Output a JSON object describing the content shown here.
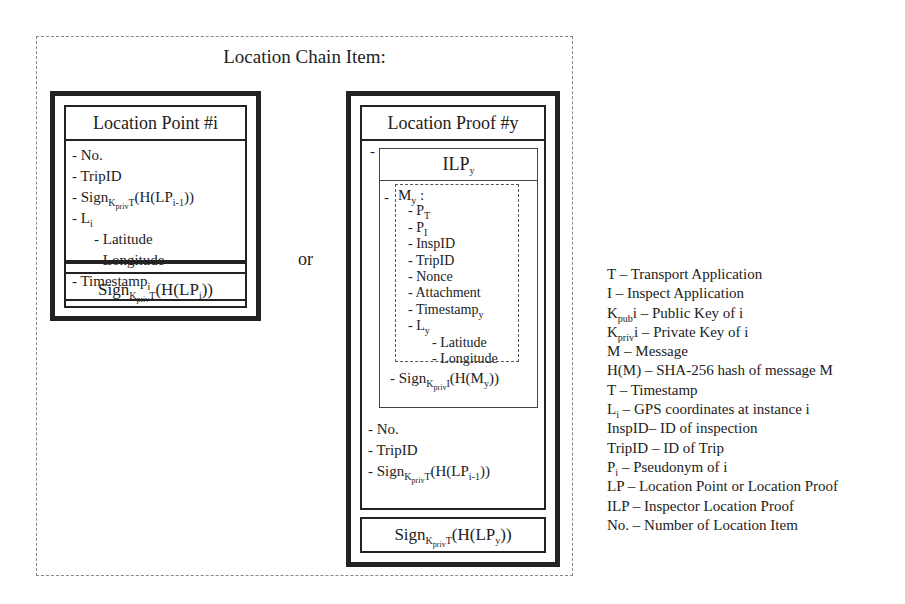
{
  "title": "Location Chain Item:",
  "separator": "or",
  "location_point": {
    "header": "Location Point #i",
    "items": [
      {
        "prefix": "- ",
        "text": "No.",
        "indent": 0
      },
      {
        "prefix": "- ",
        "text": "TripID",
        "indent": 0
      },
      {
        "prefix": "- ",
        "text": "Sign",
        "sub": "KprivT",
        "suffix": "(H(LP",
        "sub2": "i-1",
        "suffix2": "))",
        "indent": 0
      },
      {
        "prefix": "- ",
        "text": "L",
        "sub": "i",
        "indent": 0
      },
      {
        "prefix": "- ",
        "text": "Latitude",
        "indent": 1
      },
      {
        "prefix": "- ",
        "text": "Longitude",
        "indent": 1
      },
      {
        "prefix": "- ",
        "text": "Timestamp",
        "sub": "i",
        "indent": 0
      }
    ],
    "signature": {
      "text": "Sign",
      "sub": "KprivT",
      "suffix": "(H(LP",
      "sub2": "i",
      "suffix2": "))"
    }
  },
  "location_proof": {
    "header": "Location Proof #y",
    "ilp_dash": "-",
    "ilp": {
      "text": "ILP",
      "sub": "y"
    },
    "message": {
      "label": "M",
      "label_sub": "y",
      "label_suffix": " :",
      "items": [
        {
          "text": "P",
          "sub": "T",
          "indent": 0
        },
        {
          "text": "P",
          "sub": "I",
          "indent": 0
        },
        {
          "text": "InspID",
          "indent": 0
        },
        {
          "text": "TripID",
          "indent": 0
        },
        {
          "text": "Nonce",
          "indent": 0
        },
        {
          "text": "Attachment",
          "indent": 0
        },
        {
          "text": "Timestamp",
          "sub": "y",
          "indent": 0
        },
        {
          "text": "L",
          "sub": "y",
          "indent": 0
        },
        {
          "text": "Latitude",
          "indent": 1
        },
        {
          "text": "Longitude",
          "indent": 1
        }
      ]
    },
    "ilp_signature": {
      "prefix": "- ",
      "text": "Sign",
      "sub": "KprivI",
      "suffix": "(H(M",
      "sub2": "y",
      "suffix2": "))"
    },
    "items": [
      {
        "prefix": "- ",
        "text": "No."
      },
      {
        "prefix": "- ",
        "text": "TripID"
      },
      {
        "prefix": "- ",
        "text": "Sign",
        "sub": "KprivT",
        "suffix": "(H(LP",
        "sub2": "i-1",
        "suffix2": "))"
      }
    ],
    "signature": {
      "text": "Sign",
      "sub": "KprivT",
      "suffix": "(H(LP",
      "sub2": "y",
      "suffix2": "))"
    }
  },
  "legend": [
    {
      "term": "T",
      "sub": "",
      "sep": " – ",
      "desc": "Transport Application"
    },
    {
      "term": "I",
      "sub": "",
      "sep": " – ",
      "desc": "Inspect Application"
    },
    {
      "term": "K",
      "sub": "pub",
      "sep": "i – ",
      "desc": "Public Key of i"
    },
    {
      "term": "K",
      "sub": "priv",
      "sep": "i – ",
      "desc": "Private Key of i"
    },
    {
      "term": "M",
      "sub": "",
      "sep": " – ",
      "desc": "Message"
    },
    {
      "term": "H(M)",
      "sub": "",
      "sep": " – ",
      "desc": "SHA-256 hash of message M"
    },
    {
      "term": "T",
      "sub": "",
      "sep": " – ",
      "desc": "Timestamp"
    },
    {
      "term": "L",
      "sub": "i",
      "sep": " – ",
      "desc": "GPS coordinates at instance i"
    },
    {
      "term": "InspID",
      "sub": "",
      "sep": "– ",
      "desc": "ID of inspection"
    },
    {
      "term": "TripID",
      "sub": "",
      "sep": " – ",
      "desc": "ID of Trip"
    },
    {
      "term": "P",
      "sub": "i",
      "sep": " – ",
      "desc": "Pseudonym of i"
    },
    {
      "term": "LP",
      "sub": "",
      "sep": " – ",
      "desc": "Location Point or Location Proof"
    },
    {
      "term": "ILP",
      "sub": "",
      "sep": " – ",
      "desc": "Inspector Location Proof"
    },
    {
      "term": "No.",
      "sub": "",
      "sep": " – ",
      "desc": "Number of Location Item"
    }
  ]
}
